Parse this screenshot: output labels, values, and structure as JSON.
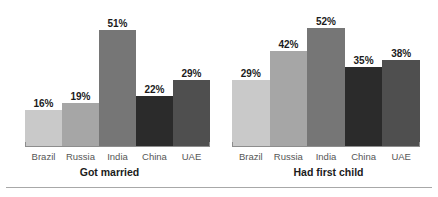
{
  "chart_data": {
    "type": "bar",
    "title": "",
    "xlabel": "",
    "ylabel": "",
    "ylim": [
      0,
      60
    ],
    "grid": false,
    "legend": "none",
    "value_suffix": "%",
    "categories": [
      "Brazil",
      "Russia",
      "India",
      "China",
      "UAE"
    ],
    "category_colors": [
      "#c9c9c9",
      "#a6a6a6",
      "#767676",
      "#2b2b2b",
      "#4f4f4f"
    ],
    "panels": [
      {
        "title": "Got married",
        "categories": [
          "Brazil",
          "Russia",
          "India",
          "China",
          "UAE"
        ],
        "values": [
          16,
          19,
          51,
          22,
          29
        ],
        "labels": [
          "16%",
          "19%",
          "51%",
          "22%",
          "29%"
        ]
      },
      {
        "title": "Had first child",
        "categories": [
          "Brazil",
          "Russia",
          "India",
          "China",
          "UAE"
        ],
        "values": [
          29,
          42,
          52,
          35,
          38
        ],
        "labels": [
          "29%",
          "42%",
          "52%",
          "35%",
          "38%"
        ]
      }
    ],
    "series": [
      {
        "name": "Got married",
        "values": [
          16,
          19,
          51,
          22,
          29
        ]
      },
      {
        "name": "Had first child",
        "values": [
          29,
          42,
          52,
          35,
          38
        ]
      }
    ],
    "colors": {
      "axis": "#8d8d8d",
      "rule": "#a8a8a8",
      "value_text": "#1b1b1b",
      "category_text": "#565656",
      "title_text": "#1b1b1b",
      "background": "#ffffff"
    }
  }
}
